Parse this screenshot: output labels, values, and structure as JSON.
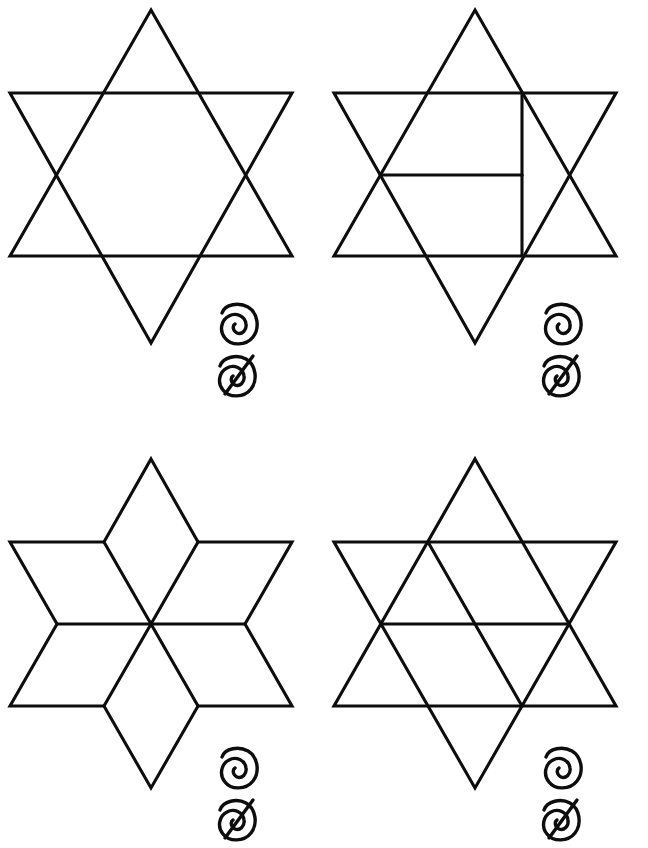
{
  "page": {
    "background_color": "#ffffff",
    "ink_color": "#0d0d0d",
    "width": 648,
    "height": 848
  },
  "glyph_labels": {
    "spiral": "spiral-glyph",
    "spiral_slashed": "spiral-slashed-glyph"
  },
  "figures": [
    {
      "id": "figure-1",
      "position": "top-left",
      "name": "Hexagram outline, no internal lines",
      "internal_lines": 0,
      "regions": 13,
      "glyphs": [
        "spiral",
        "spiral-slashed"
      ]
    },
    {
      "id": "figure-2",
      "position": "top-right",
      "name": "Hexagram with two internal lines",
      "internal_lines": 2,
      "regions": 15,
      "glyphs": [
        "spiral",
        "spiral-slashed"
      ]
    },
    {
      "id": "figure-3",
      "position": "bottom-left",
      "name": "Hexagram fully triangulated from center",
      "internal_lines": 6,
      "regions": 18,
      "glyphs": [
        "spiral",
        "spiral-slashed"
      ]
    },
    {
      "id": "figure-4",
      "position": "bottom-right",
      "name": "Hexagram with two full chord lines",
      "internal_lines": 2,
      "regions": 16,
      "glyphs": [
        "spiral",
        "spiral-slashed"
      ]
    }
  ],
  "geometry": {
    "note": "Local coordinates within each 324x424 cell.",
    "star_points": {
      "top": [
        151,
        10
      ],
      "upper_right": [
        292,
        93
      ],
      "lower_right": [
        292,
        256
      ],
      "bottom": [
        151,
        343
      ],
      "lower_left": [
        10,
        256
      ],
      "upper_left": [
        10,
        93
      ]
    },
    "hexagon_points": {
      "top_left": [
        104,
        93
      ],
      "top_right": [
        198,
        93
      ],
      "right": [
        245,
        175
      ],
      "bottom_right": [
        198,
        256
      ],
      "bottom_left": [
        104,
        256
      ],
      "left": [
        57,
        175
      ]
    }
  }
}
